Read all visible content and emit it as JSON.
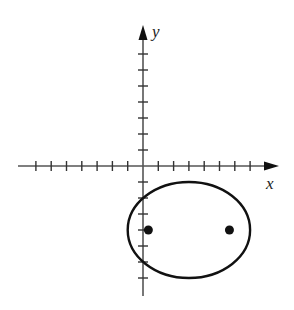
{
  "diagram": {
    "type": "coordinate-plane-ellipse",
    "colors": {
      "background": "#ffffff",
      "axis": "#555555",
      "curve": "#111111",
      "point": "#111111",
      "label": "#222222"
    },
    "axes": {
      "x_label": "x",
      "y_label": "y",
      "x_ticks_negative": 7,
      "x_ticks_positive": 7,
      "y_ticks_positive": 7,
      "y_ticks_negative": 7,
      "x_range": [
        -8,
        8.5
      ],
      "y_range": [
        -8,
        8.7
      ]
    },
    "ellipse": {
      "center": [
        3,
        -4
      ],
      "semi_major_axis_x": 4,
      "semi_minor_axis_y": 3
    },
    "points": [
      {
        "name": "left-focus",
        "x": 0.35,
        "y": -4
      },
      {
        "name": "right-focus",
        "x": 5.65,
        "y": -4
      }
    ]
  }
}
